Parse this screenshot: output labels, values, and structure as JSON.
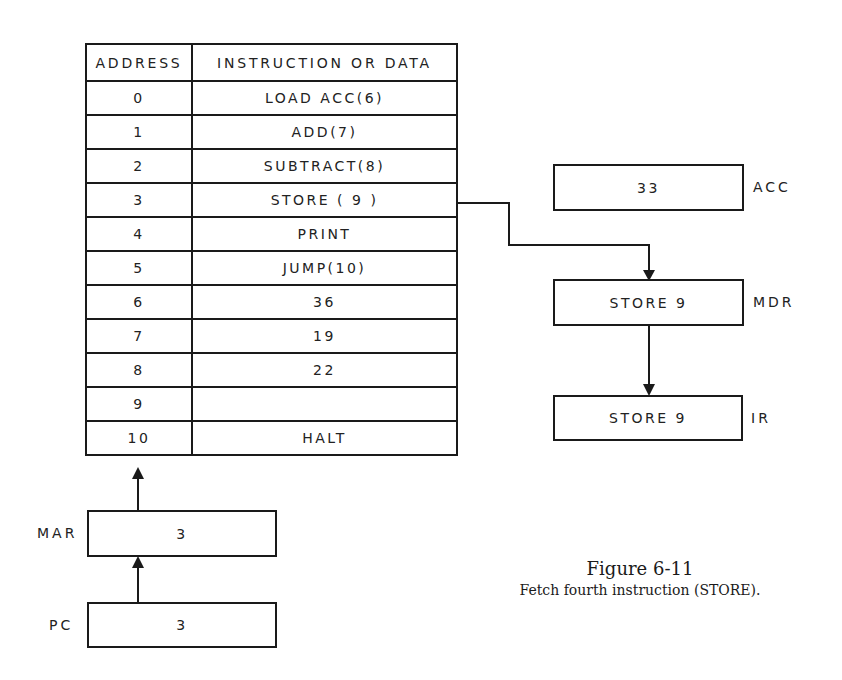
{
  "memory_table": {
    "headers": {
      "address": "ADDRESS",
      "content": "INSTRUCTION OR DATA"
    },
    "rows": [
      {
        "address": "0",
        "content": "LOAD ACC(6)"
      },
      {
        "address": "1",
        "content": "ADD(7)"
      },
      {
        "address": "2",
        "content": "SUBTRACT(8)"
      },
      {
        "address": "3",
        "content": "STORE ( 9 )"
      },
      {
        "address": "4",
        "content": "PRINT"
      },
      {
        "address": "5",
        "content": "JUMP(10)"
      },
      {
        "address": "6",
        "content": "36"
      },
      {
        "address": "7",
        "content": "19"
      },
      {
        "address": "8",
        "content": "22"
      },
      {
        "address": "9",
        "content": ""
      },
      {
        "address": "10",
        "content": "HALT"
      }
    ]
  },
  "registers": {
    "acc": {
      "label": "ACC",
      "value": "33"
    },
    "mdr": {
      "label": "MDR",
      "value": "STORE 9"
    },
    "ir": {
      "label": "IR",
      "value": "STORE 9"
    },
    "mar": {
      "label": "MAR",
      "value": "3"
    },
    "pc": {
      "label": "PC",
      "value": "3"
    }
  },
  "caption": {
    "title": "Figure 6-11",
    "text": "Fetch fourth instruction (STORE)."
  },
  "connections": [
    {
      "from": "memory-row-3",
      "to": "mdr"
    },
    {
      "from": "mdr",
      "to": "ir"
    },
    {
      "from": "mar",
      "to": "memory"
    },
    {
      "from": "pc",
      "to": "mar"
    }
  ]
}
